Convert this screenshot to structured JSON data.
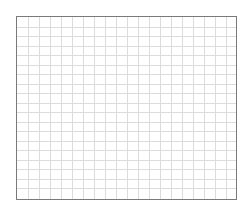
{
  "grid": {
    "columns": 20,
    "rows": 19,
    "cell_width": 11,
    "cell_height": 9.5,
    "line_color": "#dcdcdc",
    "border_color": "#7a7a7a",
    "background": "#ffffff"
  }
}
